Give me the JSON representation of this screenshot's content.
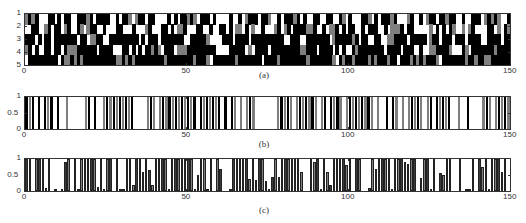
{
  "figure": {
    "captions": [
      "(a)",
      "(b)",
      "(c)"
    ]
  },
  "colors": {
    "black": "#000000",
    "gray": "#7f7f7f",
    "white": "#ffffff",
    "axis": "#333333"
  },
  "chart_data": [
    {
      "id": "a",
      "type": "heatmap",
      "title": "",
      "caption": "(a)",
      "xlabel": "",
      "ylabel": "",
      "xlim": [
        0,
        150
      ],
      "ylim": [
        1,
        5
      ],
      "x_ticks": [
        0,
        50,
        100,
        150
      ],
      "y_ticks": [
        1,
        2,
        3,
        4,
        5
      ],
      "grid": false,
      "legend": null,
      "value_levels": {
        "0": "white",
        "1": "gray",
        "2": "black"
      },
      "rows": [
        "121200022020220022212022220020221012202200002020221210222020000200201222022100202221202002200220021020002210202221200012002012202212200200222012121002",
        "002200120220120021012200200022000200012000220201120002200200220201102010020001201202222112002011202022002022200201112022000001020202100101200002201021",
        "222020220222222202201122002222222220202220222222200222221000022202222022222222220022200222222201222221202200220011222202222201220222022202222002222022",
        "120200220220211122222202222000220202022121022201112222222220000222220102222022222222211222022220202002122222222022220222002001122221000210222222212222",
        "022222222202112121222222222211212122222222212222222212221022222221222222202222122222222122222221021221222212122212202221212122210222222212212211222222"
      ]
    },
    {
      "id": "b",
      "type": "bar",
      "title": "",
      "caption": "(b)",
      "xlabel": "",
      "ylabel": "",
      "xlim": [
        0,
        150
      ],
      "ylim": [
        0,
        1
      ],
      "x_ticks": [
        0,
        50,
        100,
        150
      ],
      "y_ticks": [
        0,
        0.5,
        1
      ],
      "grid": false,
      "legend": null,
      "values": "111010111010010000011010011111111110000111011111111111101111111010110101110000000111110111111101101111011111111101001011010111110110111110010010000111011111",
      "bar_shade": "alternating black/gray"
    },
    {
      "id": "c",
      "type": "bar",
      "title": "",
      "caption": "(c)",
      "xlabel": "",
      "ylabel": "",
      "xlim": [
        0,
        150
      ],
      "ylim": [
        0,
        1
      ],
      "x_ticks": [
        0,
        50,
        100,
        150
      ],
      "y_ticks": [
        0,
        0.5,
        1
      ],
      "grid": false,
      "legend": null,
      "values": [
        1,
        1,
        0,
        1,
        1,
        1,
        0.08,
        1,
        0,
        0.02,
        0,
        0.05,
        0.9,
        1,
        0,
        1,
        0.05,
        1,
        1,
        1,
        1,
        1,
        0.12,
        1,
        0.03,
        1,
        1,
        0,
        1,
        0.03,
        0.03,
        1,
        1,
        0.2,
        1,
        1,
        0.6,
        1,
        0.65,
        0.2,
        1,
        1,
        1,
        1,
        0.03,
        1,
        1,
        1,
        1,
        1,
        1,
        1,
        0.05,
        0.5,
        1,
        1,
        0.03,
        1,
        0,
        1,
        0.7,
        0,
        0,
        0.05,
        1,
        1,
        1,
        1,
        1,
        0.38,
        1,
        0.35,
        1,
        1,
        0.3,
        0.05,
        0.45,
        1,
        0.45,
        1,
        1,
        1,
        1,
        1,
        1,
        0.6,
        0,
        0,
        1,
        0.9,
        1,
        0.03,
        1,
        0.6,
        0.2,
        1,
        1,
        1,
        1,
        0.8,
        1,
        0,
        1,
        1,
        0,
        0,
        0.1,
        1,
        0.7,
        1,
        1,
        1,
        1,
        0.02,
        1,
        1,
        1,
        0.9,
        0.85,
        1,
        1,
        0,
        0.4,
        1,
        1,
        0.02,
        1,
        0,
        0.55,
        0.5,
        1,
        1,
        0,
        0,
        1,
        0,
        0.02,
        0.05,
        1,
        0,
        1,
        0.75,
        1,
        0.03,
        1,
        1,
        1,
        0.6,
        1,
        0
      ],
      "bar_shade": "alternating black/gray"
    }
  ]
}
